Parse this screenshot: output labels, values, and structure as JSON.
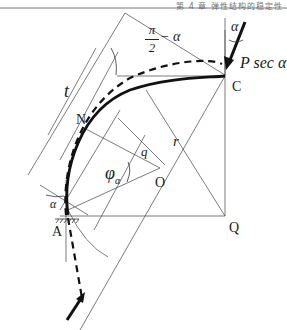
{
  "header": {
    "running_head": "第 4 章   弹性结构的稳定性"
  },
  "diagram": {
    "labels": {
      "t": "t",
      "alpha_top": "α",
      "force": "P sec α",
      "C": "C",
      "r": "r",
      "N": "N",
      "q": "q",
      "O": "O",
      "phi_alpha": "φ",
      "phi_sub": "α",
      "alpha_left": "α",
      "A": "A",
      "Q": "Q",
      "angle_num": "π",
      "angle_den": "2",
      "angle_rest": "− α"
    },
    "colors": {
      "line": "#333333",
      "curve": "#111111",
      "text": "#222222"
    }
  }
}
